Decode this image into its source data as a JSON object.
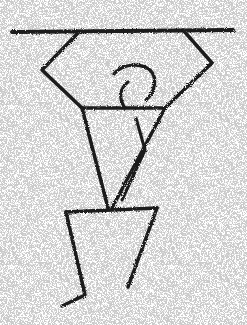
{
  "image": {
    "subject": "stippled petroglyph-style figure with raised arms holding a horizontal bar, bird-like head",
    "background_color": "#ffffff",
    "ink_color": "#1a1a1a",
    "speckle_color": "#9a9a9a"
  },
  "figure": {
    "bar": [
      [
        12,
        32
      ],
      [
        233,
        30
      ]
    ],
    "left_arm": [
      [
        78,
        33
      ],
      [
        42,
        70
      ],
      [
        82,
        108
      ]
    ],
    "right_arm": [
      [
        183,
        30
      ],
      [
        212,
        63
      ],
      [
        165,
        108
      ]
    ],
    "shoulders": [
      [
        82,
        108
      ],
      [
        165,
        108
      ]
    ],
    "head": "M125,108 C118,98 120,88 128,82 C122,78 116,76 114,74 C122,64 140,62 150,70 C158,78 155,92 146,100",
    "torso_left": [
      [
        82,
        108
      ],
      [
        108,
        208
      ]
    ],
    "torso_right": [
      [
        165,
        108
      ],
      [
        112,
        208
      ]
    ],
    "inner_arm": [
      [
        128,
        108
      ],
      [
        140,
        150
      ],
      [
        122,
        200
      ]
    ],
    "hips": [
      [
        66,
        212
      ],
      [
        157,
        208
      ]
    ],
    "left_leg": [
      [
        66,
        212
      ],
      [
        85,
        295
      ],
      [
        62,
        306
      ]
    ],
    "right_leg": [
      [
        157,
        208
      ],
      [
        128,
        287
      ]
    ]
  }
}
